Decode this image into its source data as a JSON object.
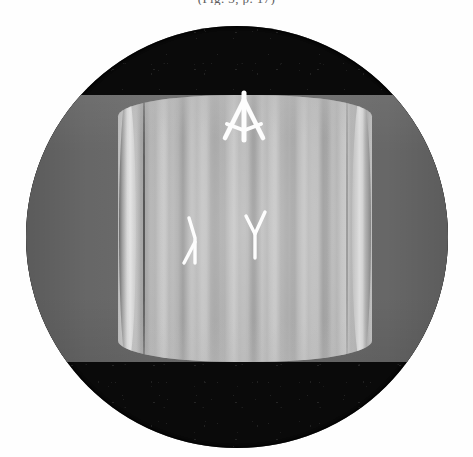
{
  "figure": {
    "kind": "scientific-micrograph",
    "caption_fragment": "(Fig. 3, p. 17)",
    "field_of_view": {
      "shape": "circle",
      "center_x": 237,
      "center_y": 237,
      "radius": 211,
      "surround_color": "#0a0a0a",
      "label": "circular microscope field of view"
    },
    "specimen_band": {
      "label": "horizontal specimen band",
      "color": "#6c6c6c",
      "top": 95,
      "bottom": 362
    },
    "bright_region": {
      "label": "bright central lens region with vertical interference fringes",
      "color": "#b6b6b6",
      "left": 118,
      "right": 372,
      "fringe_orientation": "vertical",
      "approx_fringe_count": 9
    },
    "annotations": [
      {
        "id": "arrow-marker",
        "glyph": "arrow-up",
        "color": "#fdfdfd",
        "x": 221,
        "y": 90,
        "description": "white arrowhead pointing up at apex of bright region"
      },
      {
        "id": "lambda-marker",
        "glyph": "lambda",
        "color": "#fdfdfd",
        "x": 178,
        "y": 216,
        "description": "white lambda-shaped tick mark, left of centre"
      },
      {
        "id": "y-marker",
        "glyph": "Y",
        "color": "#fdfdfd",
        "x": 242,
        "y": 210,
        "description": "white Y-shaped tick mark, right of centre"
      }
    ],
    "palette": {
      "page": "#fefefe",
      "vignette": "#0a0a0a",
      "band_gray": "#6c6c6c",
      "bright_gray": "#b6b6b6",
      "marker_white": "#fdfdfd"
    }
  }
}
